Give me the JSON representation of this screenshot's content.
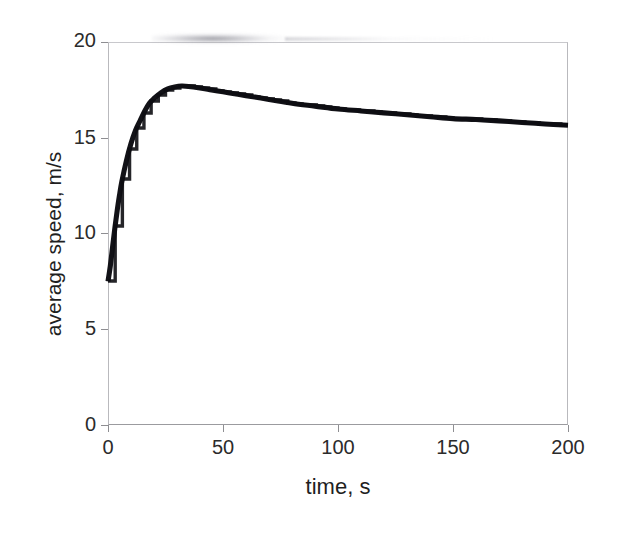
{
  "chart_data": {
    "type": "line",
    "title": "",
    "subtitle": "",
    "xlabel": "time, s",
    "ylabel": "average speed, m/s",
    "xlim": [
      0,
      200
    ],
    "ylim": [
      0,
      20
    ],
    "xticks": [
      "0",
      "50",
      "100",
      "150",
      "200"
    ],
    "xtick_values": [
      0,
      50,
      100,
      150,
      200
    ],
    "yticks": [
      "0",
      "5",
      "10",
      "15",
      "20"
    ],
    "ytick_values": [
      0,
      5,
      10,
      15,
      20
    ],
    "grid": false,
    "legend": null,
    "legend_position": "none",
    "line_color": "#121217",
    "series": [
      {
        "name": "average speed",
        "x": [
          0,
          1,
          2,
          3,
          4,
          5,
          6,
          8,
          10,
          12,
          14,
          16,
          18,
          20,
          23,
          26,
          29,
          32,
          35,
          40,
          45,
          50,
          55,
          60,
          70,
          80,
          90,
          100,
          110,
          120,
          130,
          140,
          150,
          160,
          170,
          180,
          190,
          200
        ],
        "y": [
          7.5,
          8.3,
          9.3,
          10.3,
          11.2,
          12.0,
          12.7,
          13.8,
          14.7,
          15.4,
          15.9,
          16.4,
          16.8,
          17.05,
          17.35,
          17.55,
          17.65,
          17.7,
          17.68,
          17.6,
          17.5,
          17.4,
          17.3,
          17.2,
          17.0,
          16.8,
          16.65,
          16.5,
          16.4,
          16.3,
          16.2,
          16.1,
          16.0,
          15.95,
          15.88,
          15.8,
          15.72,
          15.65
        ]
      }
    ],
    "annotations": [
      {
        "name": "top-border-scan-smudge",
        "description": "faint grey blur along upper plot border"
      },
      {
        "name": "clipped-top-tick-label",
        "description": "the 20 label at the top of the y-axis is clipped by the page edge"
      }
    ]
  },
  "axes": {
    "y": {
      "label": "average speed, m/s",
      "ticks": [
        {
          "label": "20",
          "value": 20
        },
        {
          "label": "15",
          "value": 15
        },
        {
          "label": "10",
          "value": 10
        },
        {
          "label": "5",
          "value": 5
        },
        {
          "label": "0",
          "value": 0
        }
      ]
    },
    "x": {
      "label": "time, s",
      "ticks": [
        {
          "label": "0",
          "value": 0
        },
        {
          "label": "50",
          "value": 50
        },
        {
          "label": "100",
          "value": 100
        },
        {
          "label": "150",
          "value": 150
        },
        {
          "label": "200",
          "value": 200
        }
      ]
    }
  }
}
